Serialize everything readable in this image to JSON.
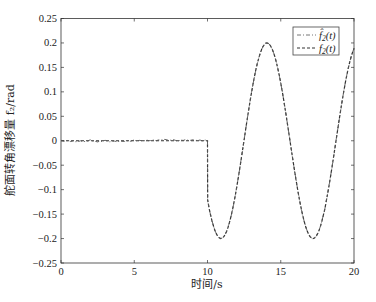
{
  "chart_data": {
    "type": "line",
    "title": "",
    "xlabel": "时间/s",
    "ylabel": "舵面转角漂移量 f₂/rad",
    "xlim": [
      0,
      20
    ],
    "ylim": [
      -0.25,
      0.25
    ],
    "xticks": [
      0,
      5,
      10,
      15,
      20
    ],
    "xtick_labels": [
      "0",
      "5",
      "10",
      "15",
      "20"
    ],
    "yticks": [
      0.25,
      0.2,
      0.15,
      0.1,
      0.05,
      0,
      -0.05,
      -0.1,
      -0.15,
      -0.2,
      -0.25
    ],
    "ytick_labels": [
      "0.25",
      "0.2",
      "0.15",
      "0.1",
      "0.05",
      "0",
      "−0.05",
      "−0.1",
      "−0.15",
      "−0.2",
      "−0.25"
    ],
    "grid": false,
    "legend_position": "upper right",
    "x": [
      0,
      1,
      2,
      3,
      4,
      5,
      6,
      7,
      8,
      9,
      10,
      10.01,
      10.5,
      11,
      11.5,
      12,
      12.5,
      13,
      13.5,
      14,
      14.5,
      15,
      15.5,
      16,
      16.5,
      17,
      17.5,
      18,
      18.5,
      19,
      19.5,
      20
    ],
    "series": [
      {
        "name": "f̂₂(t)",
        "style": "dash-dot",
        "color": "#555555",
        "values": [
          0.001,
          -0.002,
          0.002,
          0.001,
          -0.001,
          0.002,
          0.0,
          0.003,
          -0.001,
          0.002,
          0.001,
          -0.121,
          -0.183,
          -0.199,
          -0.167,
          -0.094,
          0.002,
          0.098,
          0.169,
          0.2,
          0.181,
          0.118,
          0.026,
          -0.072,
          -0.153,
          -0.196,
          -0.191,
          -0.141,
          -0.054,
          0.045,
          0.133,
          0.189
        ]
      },
      {
        "name": "f₂(t)",
        "style": "dashed",
        "color": "#333333",
        "values": [
          0,
          0,
          0,
          0,
          0,
          0,
          0,
          0,
          0,
          0,
          0,
          -0.121,
          -0.183,
          -0.199,
          -0.167,
          -0.094,
          0.002,
          0.098,
          0.169,
          0.2,
          0.181,
          0.118,
          0.026,
          -0.072,
          -0.153,
          -0.196,
          -0.191,
          -0.141,
          -0.054,
          0.045,
          0.133,
          0.189
        ]
      }
    ]
  },
  "legend": {
    "items": [
      {
        "main": "f",
        "hat": "̂",
        "sub": "2",
        "arg": "(t)"
      },
      {
        "main": "f",
        "hat": "",
        "sub": "2",
        "arg": "(t)"
      }
    ]
  },
  "labels": {
    "xlabel": "时间/s",
    "ylabel": "舵面转角漂移量 f₂/rad"
  }
}
